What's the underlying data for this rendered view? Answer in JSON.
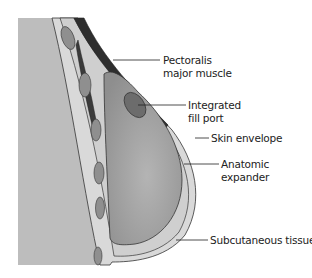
{
  "diagram": {
    "labels": [
      {
        "id": "pectoralis",
        "line1": "Pectoralis",
        "line2": "major muscle"
      },
      {
        "id": "fill-port",
        "line1": "Integrated",
        "line2": "fill port"
      },
      {
        "id": "skin",
        "line1": "Skin envelope",
        "line2": ""
      },
      {
        "id": "expander",
        "line1": "Anatomic",
        "line2": "expander"
      },
      {
        "id": "subcutaneous",
        "line1": "Subcutaneous tissue",
        "line2": ""
      }
    ],
    "colors": {
      "chest_wall": "#b9b9b9",
      "expander": "#9d9d9d",
      "muscle": "#3a3a3a",
      "port": "#6f6f6f",
      "skin": "#d6d6d6",
      "outline": "#333333",
      "label_text": "#222222"
    }
  }
}
